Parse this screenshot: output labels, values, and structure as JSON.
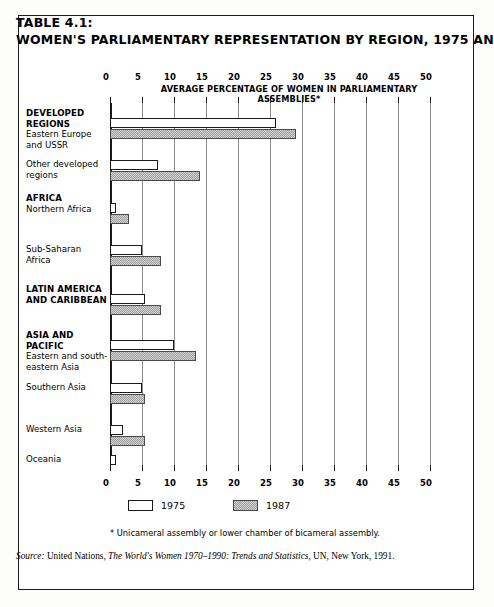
{
  "title": {
    "line1": "TABLE 4.1:",
    "line2": "WOMEN'S PARLIAMENTARY REPRESENTATION BY REGION, 1975 AND 1987"
  },
  "axis_caption": "AVERAGE PERCENTAGE OF WOMEN IN PARLIAMENTARY ASSEMBLIES*",
  "legend": {
    "item1": "1975",
    "item2": "1987"
  },
  "footnote": "* Unicameral assembly or lower chamber of bicameral assembly.",
  "source": {
    "prefix": "Source:",
    "agency": "United Nations,",
    "work": "The World's Women 1970–1990: Trends and Statistics",
    "suffix": ", UN, New York, 1991."
  },
  "colors": {
    "bar_1975": "#ffffff",
    "bar_1987": "#9e9e9e",
    "outline": "#1a1a1a",
    "gridline": "#8d8d8d",
    "background": "#ffffff"
  },
  "chart_data": {
    "type": "bar",
    "orientation": "horizontal",
    "title": "WOMEN'S PARLIAMENTARY REPRESENTATION BY REGION, 1975 AND 1987",
    "xlabel": "AVERAGE PERCENTAGE OF WOMEN IN PARLIAMENTARY ASSEMBLIES*",
    "ylabel": "",
    "xlim": [
      0,
      50
    ],
    "xticks": [
      0,
      5,
      10,
      15,
      20,
      25,
      30,
      35,
      40,
      45,
      50
    ],
    "xtick_labels": [
      "0",
      "5",
      "10",
      "15",
      "20",
      "25",
      "30",
      "35",
      "40",
      "45",
      "50"
    ],
    "grid": true,
    "legend_position": "bottom",
    "categories": [
      {
        "header": "DEVELOPED REGIONS",
        "sub": "Eastern Europe\nand USSR"
      },
      {
        "header": "",
        "sub": "Other developed\nregions"
      },
      {
        "header": "AFRICA",
        "sub": "Northern Africa"
      },
      {
        "header": "",
        "sub": "Sub-Saharan\nAfrica"
      },
      {
        "header": "LATIN AMERICA\nAND CARIBBEAN",
        "sub": ""
      },
      {
        "header": "ASIA AND PACIFIC",
        "sub": "Eastern and south-\neastern Asia"
      },
      {
        "header": "",
        "sub": "Southern Asia"
      },
      {
        "header": "",
        "sub": "Western Asia"
      },
      {
        "header": "",
        "sub": "Oceania"
      }
    ],
    "series": [
      {
        "name": "1975",
        "values": [
          26.0,
          7.5,
          1.0,
          5.0,
          5.5,
          10.0,
          5.0,
          2.0,
          1.0
        ]
      },
      {
        "name": "1987",
        "values": [
          29.0,
          14.0,
          3.0,
          8.0,
          8.0,
          13.5,
          5.5,
          5.5,
          null
        ]
      }
    ]
  },
  "rows": [
    {
      "label_header": "DEVELOPED REGIONS",
      "label_lines": [
        "Eastern Europe",
        "and USSR"
      ],
      "v1975": 26.0,
      "v1987": 29.0,
      "top": 118
    },
    {
      "label_header": "",
      "label_lines": [
        "Other developed",
        "regions"
      ],
      "v1975": 7.5,
      "v1987": 14.0,
      "top": 160
    },
    {
      "label_header": "AFRICA",
      "label_lines": [
        "Northern Africa"
      ],
      "v1975": 1.0,
      "v1987": 3.0,
      "top": 203
    },
    {
      "label_header": "",
      "label_lines": [
        "Sub-Saharan",
        "Africa"
      ],
      "v1975": 5.0,
      "v1987": 8.0,
      "top": 245
    },
    {
      "label_header": "LATIN AMERICA",
      "label_lines": [
        "AND CARIBBEAN"
      ],
      "v1975": 5.5,
      "v1987": 8.0,
      "top": 294
    },
    {
      "label_header": "ASIA AND PACIFIC",
      "label_lines": [
        "Eastern and south-",
        "eastern Asia"
      ],
      "v1975": 10.0,
      "v1987": 13.5,
      "top": 340
    },
    {
      "label_header": "",
      "label_lines": [
        "Southern Asia"
      ],
      "v1975": 5.0,
      "v1987": 5.5,
      "top": 383
    },
    {
      "label_header": "",
      "label_lines": [
        "Western Asia"
      ],
      "v1975": 2.0,
      "v1987": 5.5,
      "top": 425
    },
    {
      "label_header": "",
      "label_lines": [
        "Oceania"
      ],
      "v1975": 1.0,
      "v1987": null,
      "top": 455
    }
  ]
}
